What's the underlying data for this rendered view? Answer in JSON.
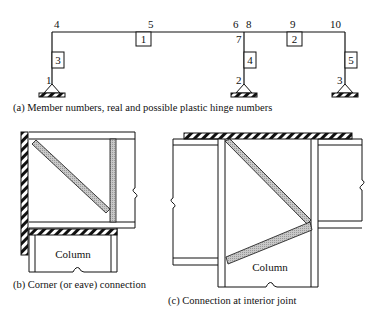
{
  "panel_a": {
    "caption": "(a) Member numbers, real and possible plastic hinge numbers",
    "hinge_numbers": [
      "1",
      "2",
      "3",
      "4",
      "5",
      "6",
      "7",
      "8",
      "9",
      "10"
    ],
    "member_numbers": [
      "1",
      "2",
      "3",
      "4",
      "5"
    ]
  },
  "panel_b": {
    "caption": "(b) Corner (or eave) connection",
    "column_label": "Column"
  },
  "panel_c": {
    "caption": "(c) Connection at interior joint",
    "column_label": "Column"
  }
}
